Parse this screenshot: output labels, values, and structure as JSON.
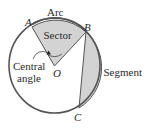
{
  "diagram": {
    "labels": {
      "arc": "Arc",
      "sector": "Sector",
      "segment": "Segment",
      "central_angle_line1": "Central",
      "central_angle_line2": "angle",
      "point_a": "A",
      "point_b": "B",
      "point_c": "C",
      "point_o": "O"
    },
    "colors": {
      "stroke": "#555555",
      "shade": "#d3d3d3",
      "text": "#2a2a2a",
      "background": "#ffffff"
    }
  }
}
